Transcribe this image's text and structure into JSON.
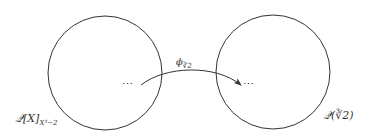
{
  "diagram": {
    "type": "mapping-diagram",
    "left_set": {
      "label_main": "𝒬[X]",
      "label_sub": "X³−2",
      "full_label": "Q[X]_{X^3-2}",
      "element": "⋯",
      "circle": {
        "cx": 105,
        "cy": 73,
        "r": 57
      }
    },
    "right_set": {
      "label": "𝒬(∛2)",
      "full_label": "Q(∛2)",
      "element": "⋯",
      "circle": {
        "cx": 273,
        "cy": 72,
        "r": 57
      }
    },
    "arrow": {
      "label_main": "ϕ",
      "label_sub": "∛2",
      "full_label": "φ_{∛2}",
      "from": "left_set.element",
      "to": "right_set.element"
    },
    "colors": {
      "stroke": "#333333",
      "background": "#ffffff"
    }
  }
}
